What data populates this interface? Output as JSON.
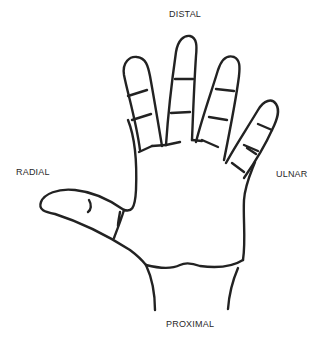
{
  "diagram": {
    "labels": {
      "top": "DISTAL",
      "left": "RADIAL",
      "right": "ULNAR",
      "bottom": "PROXIMAL"
    },
    "colors": {
      "stroke": "#222222",
      "text": "#2a2a2a",
      "background": "#ffffff"
    }
  }
}
